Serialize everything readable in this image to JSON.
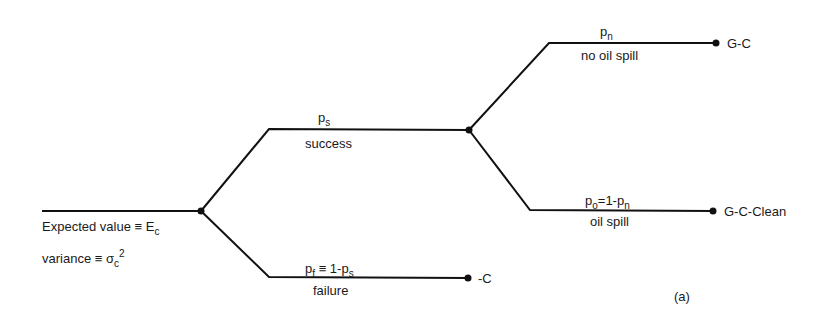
{
  "diagram": {
    "type": "decision-tree",
    "figure_label": "(a)",
    "root": {
      "expected_value_label": "Expected value ≡ E",
      "expected_value_sub": "c",
      "variance_label": "variance ≡ σ",
      "variance_sub": "c",
      "variance_sup": "2"
    },
    "branches": {
      "success": {
        "prob_main": "p",
        "prob_sub": "s",
        "label": "success"
      },
      "failure": {
        "prob_main": "p",
        "prob_sub": "f",
        "prob_mid": " ≡ 1-p",
        "prob_sub2": "s",
        "label": "failure",
        "outcome": "-C"
      },
      "no_oil_spill": {
        "prob_main": "p",
        "prob_sub": "n",
        "label": "no oil spill",
        "outcome": "G-C"
      },
      "oil_spill": {
        "prob_main": "p",
        "prob_sub": "o",
        "prob_mid": "=1-p",
        "prob_sub2": "n",
        "label": "oil spill",
        "outcome": "G-C-Clean"
      }
    },
    "colors": {
      "line": "#111111",
      "text": "#1a1a1a",
      "background": "#ffffff"
    }
  }
}
